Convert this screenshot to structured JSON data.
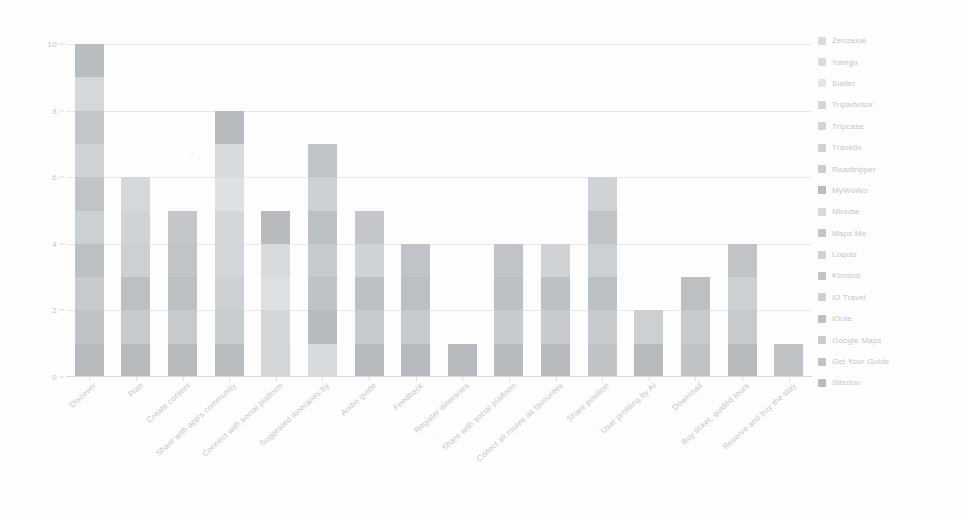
{
  "chart_data": {
    "type": "bar",
    "stacked": true,
    "title": "",
    "subtitle": "",
    "xlabel": "",
    "ylabel": "",
    "ylim": [
      0,
      10
    ],
    "yticks": [
      0,
      2,
      4,
      6,
      8,
      10
    ],
    "grid": true,
    "legend_position": "right",
    "categories": [
      "Discover",
      "Plan",
      "Create content",
      "Share with app's community",
      "Connect with social platform",
      "Suggested itineraries by",
      "Audio guide",
      "Feedback",
      "Register itineraries",
      "Share with social platform",
      "Collect all routes as favourites",
      "Share position",
      "User profiling by AI",
      "Download",
      "Buy ticket, guided tours",
      "Reserve and buy the stay"
    ],
    "totals": [
      10,
      6,
      5,
      8,
      5,
      7,
      5,
      4,
      1,
      4,
      4,
      6,
      2,
      3,
      4,
      1
    ],
    "series": [
      {
        "name": "Sitedoo",
        "color": "#8d949b",
        "values": [
          1,
          1,
          1,
          1,
          0,
          1,
          1,
          1,
          1,
          1,
          1,
          0,
          1,
          0,
          1,
          0
        ]
      },
      {
        "name": "Get Your Guide",
        "color": "#9aa1a8",
        "values": [
          0,
          0,
          0,
          0,
          0,
          0,
          0,
          0,
          0,
          0,
          0,
          1,
          0,
          1,
          0,
          1
        ]
      },
      {
        "name": "Google Maps",
        "color": "#a7aeb5",
        "values": [
          1,
          1,
          1,
          1,
          1,
          1,
          1,
          1,
          0,
          1,
          1,
          1,
          0,
          1,
          1,
          0
        ]
      },
      {
        "name": "iOute",
        "color": "#949ba2",
        "values": [
          1,
          1,
          1,
          0,
          1,
          1,
          1,
          1,
          0,
          1,
          1,
          1,
          0,
          1,
          0,
          0
        ]
      },
      {
        "name": "iO Travel",
        "color": "#aeb5bb",
        "values": [
          0,
          1,
          0,
          1,
          1,
          0,
          0,
          0,
          0,
          0,
          0,
          1,
          1,
          0,
          1,
          0
        ]
      },
      {
        "name": "Komoot",
        "color": "#9ba2a9",
        "values": [
          1,
          0,
          1,
          1,
          0,
          1,
          0,
          1,
          0,
          1,
          0,
          1,
          0,
          0,
          1,
          0
        ]
      },
      {
        "name": "Loquis",
        "color": "#b4bac0",
        "values": [
          1,
          1,
          0,
          1,
          1,
          1,
          1,
          0,
          0,
          0,
          1,
          0,
          0,
          0,
          0,
          0
        ]
      },
      {
        "name": "Maps Me",
        "color": "#a0a7ae",
        "values": [
          1,
          0,
          1,
          1,
          0,
          1,
          1,
          0,
          0,
          0,
          0,
          1,
          0,
          0,
          0,
          0
        ]
      },
      {
        "name": "Minube",
        "color": "#bcc2c7",
        "values": [
          1,
          1,
          0,
          1,
          1,
          1,
          0,
          0,
          0,
          0,
          0,
          0,
          0,
          0,
          0,
          0
        ]
      },
      {
        "name": "MyWoWo",
        "color": "#8f969d",
        "values": [
          1,
          0,
          0,
          1,
          0,
          1,
          0,
          0,
          0,
          0,
          0,
          1,
          0,
          0,
          0,
          0
        ]
      },
      {
        "name": "Roadtripper",
        "color": "#a9b0b6",
        "values": [
          1,
          0,
          0,
          1,
          0,
          0,
          0,
          0,
          0,
          0,
          0,
          0,
          0,
          0,
          0,
          0
        ]
      },
      {
        "name": "Travello",
        "color": "#b0b7bd",
        "values": [
          1,
          0,
          0,
          0,
          1,
          0,
          0,
          0,
          0,
          0,
          0,
          0,
          0,
          0,
          0,
          0
        ]
      },
      {
        "name": "Tripcase",
        "color": "#b8bec4",
        "values": [
          0,
          0,
          0,
          0,
          0,
          0,
          0,
          0,
          0,
          0,
          0,
          0,
          0,
          0,
          0,
          0
        ]
      },
      {
        "name": "Tripadvisor",
        "color": "#bac0c6",
        "values": [
          1,
          0,
          0,
          0,
          0,
          0,
          0,
          0,
          0,
          0,
          0,
          0,
          0,
          0,
          0,
          0
        ]
      },
      {
        "name": "Sialler",
        "color": "#ccd1d5",
        "values": [
          0,
          0,
          0,
          0,
          0,
          0,
          0,
          0,
          0,
          0,
          0,
          0,
          0,
          0,
          0,
          0
        ]
      },
      {
        "name": "Yamgu",
        "color": "#c1c7cc",
        "values": [
          0,
          0,
          0,
          0,
          0,
          0,
          0,
          0,
          0,
          0,
          0,
          0,
          0,
          0,
          0,
          0
        ]
      }
    ]
  },
  "legend": {
    "items": [
      {
        "label": "Zenzeloe",
        "color": "#c4cacf"
      },
      {
        "label": "Yamgu",
        "color": "#c1c7cc"
      },
      {
        "label": "Sialler",
        "color": "#d4d8db"
      },
      {
        "label": "Tripadvisor",
        "color": "#bac0c6"
      },
      {
        "label": "Tripcase",
        "color": "#b8bec4"
      },
      {
        "label": "Travello",
        "color": "#b0b7bd"
      },
      {
        "label": "Roadtripper",
        "color": "#a9b0b6"
      },
      {
        "label": "MyWoWo",
        "color": "#8f969d"
      },
      {
        "label": "Minube",
        "color": "#bcc2c7"
      },
      {
        "label": "Maps Me",
        "color": "#a0a7ae"
      },
      {
        "label": "Loquis",
        "color": "#b4bac0"
      },
      {
        "label": "Komoot",
        "color": "#9ba2a9"
      },
      {
        "label": "iO Travel",
        "color": "#aeb5bb"
      },
      {
        "label": "iOute",
        "color": "#949ba2"
      },
      {
        "label": "Google Maps",
        "color": "#a7aeb5"
      },
      {
        "label": "Get Your Guide",
        "color": "#9aa1a8"
      },
      {
        "label": "Sitedoo",
        "color": "#8d949b"
      }
    ]
  }
}
